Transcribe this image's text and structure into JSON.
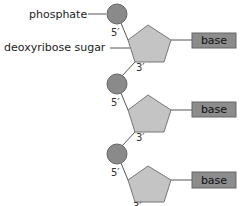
{
  "diagram": {
    "labels": {
      "phosphate": "phosphate",
      "sugar": "deoxyribose sugar"
    },
    "colors": {
      "phosphate_fill": "#8a8a8a",
      "sugar_fill": "#c4c4c4",
      "base_fill": "#8c8c8c",
      "line": "#555555"
    },
    "nucleotides": [
      {
        "prime5": "5′",
        "prime3": "3′",
        "base": "base"
      },
      {
        "prime5": "5′",
        "prime3": "3′",
        "base": "base"
      },
      {
        "prime5": "5′",
        "prime3": "3′",
        "base": "base"
      }
    ]
  }
}
